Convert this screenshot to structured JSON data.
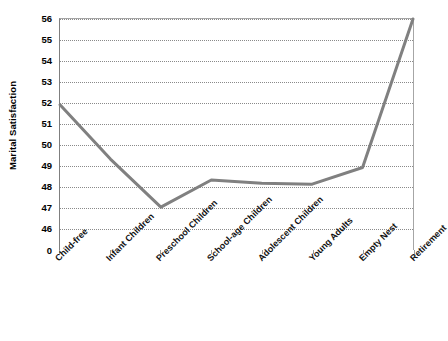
{
  "chart_data": {
    "type": "line",
    "title": "",
    "xlabel": "",
    "ylabel": "Marital Satisfaction",
    "categories": [
      "Child-free",
      "Infant Children",
      "Preschool Children",
      "School-age Children",
      "Adolescent Children",
      "Young Adults",
      "Empty Nest",
      "Retirement"
    ],
    "values": [
      51.9,
      49.3,
      47.0,
      48.3,
      48.15,
      48.1,
      48.9,
      56.0
    ],
    "series": [
      {
        "name": "Marital Satisfaction",
        "values": [
          51.9,
          49.3,
          47.0,
          48.3,
          48.15,
          48.1,
          48.9,
          56.0
        ],
        "color": "#808080"
      }
    ],
    "ytick_labels": [
      "56",
      "55",
      "54",
      "53",
      "52",
      "51",
      "50",
      "49",
      "48",
      "47",
      "46",
      "0"
    ],
    "ytick_values": [
      56,
      55,
      54,
      53,
      52,
      51,
      50,
      49,
      48,
      47,
      46,
      0
    ],
    "ylim": [
      46,
      56
    ],
    "axis_break": true,
    "grid": "horizontal-dotted",
    "legend": "none",
    "line_color": "#808080",
    "gridline_color": "#8a8a8a",
    "axis_color": "#7f7f7f",
    "markers": "none"
  }
}
